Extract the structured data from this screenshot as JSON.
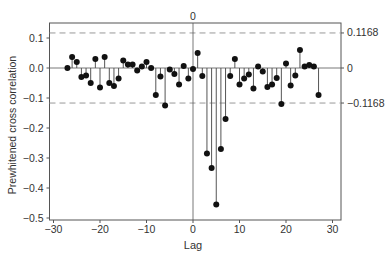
{
  "chart_data": {
    "type": "scatter",
    "subtype": "stem",
    "title": "",
    "xlabel": "Lag",
    "ylabel": "Prewhitened cross correlation",
    "xlim": [
      -31,
      31
    ],
    "ylim": [
      -0.51,
      0.15
    ],
    "x_ticks": [
      -30,
      -20,
      -10,
      0,
      10,
      20,
      30
    ],
    "x_tick_labels": [
      "−30",
      "−20",
      "−10",
      "0",
      "10",
      "20",
      "30"
    ],
    "y_ticks": [
      0.1,
      0.0,
      -0.1,
      -0.2,
      -0.3,
      -0.4,
      -0.5
    ],
    "y_tick_labels": [
      "0.1",
      "0.0",
      "−0.1",
      "−0.2",
      "−0.3",
      "−0.4",
      "−0.5"
    ],
    "top_label": "0",
    "reference_lines": {
      "upper": 0.1168,
      "lower": -0.1168,
      "zero": 0,
      "style": "dashed",
      "labels": [
        "0.1168",
        "0",
        "−0.1168"
      ]
    },
    "vertical_line_at_lag": 0,
    "grid": false,
    "legend": null,
    "x": [
      -27,
      -26,
      -25,
      -24,
      -23,
      -22,
      -21,
      -20,
      -19,
      -18,
      -17,
      -16,
      -15,
      -14,
      -13,
      -12,
      -11,
      -10,
      -9,
      -8,
      -7,
      -6,
      -5,
      -4,
      -3,
      -2,
      -1,
      0,
      1,
      2,
      3,
      4,
      5,
      6,
      7,
      8,
      9,
      10,
      11,
      12,
      13,
      14,
      15,
      16,
      17,
      18,
      19,
      20,
      21,
      22,
      23,
      24,
      25,
      26,
      27
    ],
    "values": [
      0.0,
      0.037,
      0.02,
      -0.03,
      -0.025,
      -0.05,
      0.03,
      -0.065,
      0.037,
      -0.05,
      -0.06,
      -0.035,
      0.025,
      0.012,
      0.012,
      -0.008,
      0.005,
      0.02,
      0.0,
      -0.09,
      -0.028,
      -0.125,
      -0.005,
      -0.02,
      -0.055,
      0.007,
      -0.035,
      -0.003,
      0.05,
      -0.027,
      -0.285,
      -0.333,
      -0.455,
      -0.27,
      -0.17,
      -0.027,
      0.03,
      -0.055,
      -0.035,
      -0.022,
      -0.068,
      0.005,
      -0.012,
      -0.063,
      -0.055,
      -0.033,
      -0.12,
      0.015,
      -0.058,
      -0.025,
      0.06,
      0.005,
      0.01,
      0.005,
      -0.09
    ]
  },
  "colors": {
    "points": "#111111",
    "stems": "#555555",
    "frame": "#555555",
    "dashed": "#999999",
    "text": "#333333"
  }
}
